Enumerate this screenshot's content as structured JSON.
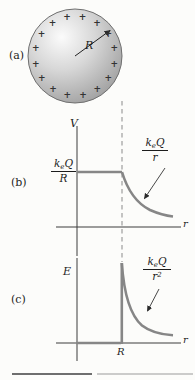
{
  "figure": {
    "panel_a": {
      "label": "(a)",
      "radius_label": "R",
      "charges": {
        "symbol": "+",
        "count": 16
      }
    },
    "panel_b": {
      "label": "(b)",
      "y_axis_label": "V",
      "x_axis_label": "r",
      "axis_value_fraction": {
        "k": "k",
        "k_sub": "e",
        "q": "Q",
        "denom": "R",
        "denom_sup": ""
      },
      "curve_label_fraction": {
        "k": "k",
        "k_sub": "e",
        "q": "Q",
        "denom": "r",
        "denom_sup": ""
      },
      "curve_shape": "constant for r<R then falls off as 1/r"
    },
    "panel_c": {
      "label": "(c)",
      "y_axis_label": "E",
      "x_axis_label": "r",
      "x_tick_label": "R",
      "curve_label_fraction": {
        "k": "k",
        "k_sub": "e",
        "q": "Q",
        "denom": "r",
        "denom_sup": "2"
      },
      "curve_shape": "zero for r<R, jumps at r=R then falls off as 1/r squared"
    },
    "colors": {
      "curve": "#868686",
      "axis": "#3c3c3c",
      "dashed_line": "#8a8a8a",
      "text": "#1c1c1c",
      "sphere_edge": "#6f6f6f",
      "background": "#fcfcfa"
    }
  }
}
